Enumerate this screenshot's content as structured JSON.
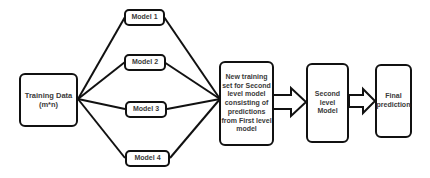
{
  "diagram": {
    "nodes": {
      "training_data": {
        "label": "Training Data\n(m*n)"
      },
      "model_1": {
        "label": "Model 1"
      },
      "model_2": {
        "label": "Model 2"
      },
      "model_3": {
        "label": "Model 3"
      },
      "model_4": {
        "label": "Model 4"
      },
      "new_training_set": {
        "label": "New training\nset for Second\nlevel model\nconsisting of\npredictions\nfrom First level\nmodel"
      },
      "second_level_model": {
        "label": "Second\nlevel\nModel"
      },
      "final_prediction": {
        "label": "Final\nprediction"
      }
    },
    "edges": [
      {
        "from": "training_data",
        "to": "model_1",
        "type": "line"
      },
      {
        "from": "training_data",
        "to": "model_2",
        "type": "line"
      },
      {
        "from": "training_data",
        "to": "model_3",
        "type": "line"
      },
      {
        "from": "training_data",
        "to": "model_4",
        "type": "line"
      },
      {
        "from": "model_1",
        "to": "new_training_set",
        "type": "line"
      },
      {
        "from": "model_2",
        "to": "new_training_set",
        "type": "line"
      },
      {
        "from": "model_3",
        "to": "new_training_set",
        "type": "line"
      },
      {
        "from": "model_4",
        "to": "new_training_set",
        "type": "line"
      },
      {
        "from": "new_training_set",
        "to": "second_level_model",
        "type": "block-arrow"
      },
      {
        "from": "second_level_model",
        "to": "final_prediction",
        "type": "block-arrow"
      }
    ],
    "colors": {
      "stroke": "#111111",
      "text": "#3a3a3a",
      "background": "#ffffff"
    }
  }
}
